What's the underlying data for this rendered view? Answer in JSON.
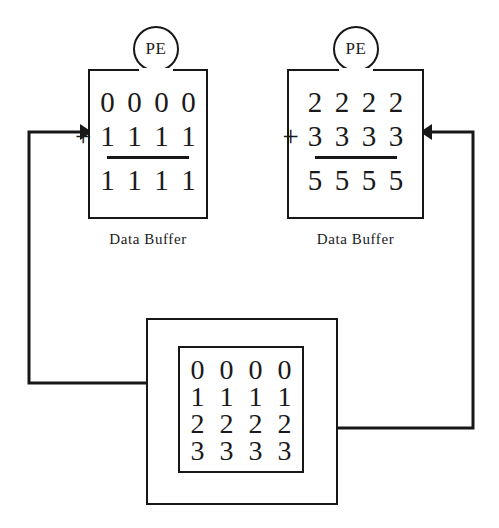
{
  "diagram": {
    "ink_color": "#171717",
    "background_color": "#ffffff"
  },
  "processing_elements": [
    {
      "id": "pe-left",
      "badge_label": "PE",
      "buffer_label": "Data Buffer",
      "operator": "+",
      "operand_top": [
        "0",
        "0",
        "0",
        "0"
      ],
      "operand_bottom": [
        "1",
        "1",
        "1",
        "1"
      ],
      "result": [
        "1",
        "1",
        "1",
        "1"
      ]
    },
    {
      "id": "pe-right",
      "badge_label": "PE",
      "buffer_label": "Data Buffer",
      "operator": "+",
      "operand_top": [
        "2",
        "2",
        "2",
        "2"
      ],
      "operand_bottom": [
        "3",
        "3",
        "3",
        "3"
      ],
      "result": [
        "5",
        "5",
        "5",
        "5"
      ]
    }
  ],
  "memory": {
    "id": "memory-module",
    "matrix_rows": [
      [
        "0",
        "0",
        "0",
        "0"
      ],
      [
        "1",
        "1",
        "1",
        "1"
      ],
      [
        "2",
        "2",
        "2",
        "2"
      ],
      [
        "3",
        "3",
        "3",
        "3"
      ]
    ]
  },
  "connections": [
    {
      "id": "memory-to-left-pe",
      "from": "memory-module",
      "to": "pe-left",
      "direction": "right",
      "arrowhead": true
    },
    {
      "id": "memory-to-right-pe",
      "from": "memory-module",
      "to": "pe-right",
      "direction": "left",
      "arrowhead": true
    }
  ]
}
